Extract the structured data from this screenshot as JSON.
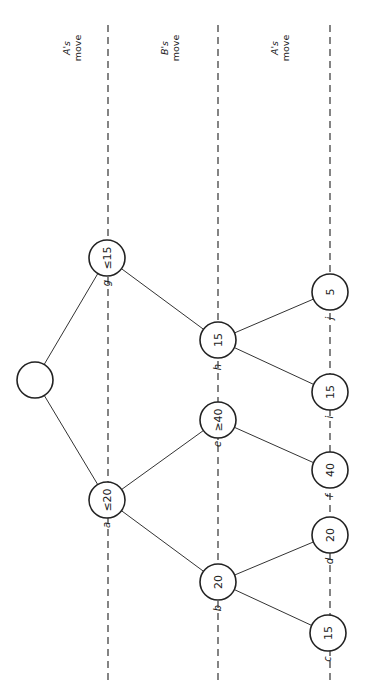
{
  "diagram": {
    "ply_labels": [
      {
        "player": "A's",
        "word": "move",
        "x": 68
      },
      {
        "player": "B's",
        "word": "move",
        "x": 170
      },
      {
        "player": "A's",
        "word": "move",
        "x": 280
      }
    ],
    "levels_x": [
      108,
      218,
      330
    ],
    "nodes": {
      "root": {
        "value": "",
        "label": ""
      },
      "g": {
        "value": "≤15",
        "label": "g"
      },
      "a": {
        "value": "≤20",
        "label": "a"
      },
      "h": {
        "value": "15",
        "label": "h"
      },
      "e": {
        "value": "≥40",
        "label": "e"
      },
      "b": {
        "value": "20",
        "label": "b"
      },
      "j": {
        "value": "5",
        "label": "j"
      },
      "i": {
        "value": "15",
        "label": "i"
      },
      "f": {
        "value": "40",
        "label": "f"
      },
      "d": {
        "value": "20",
        "label": "d"
      },
      "c": {
        "value": "15",
        "label": "c"
      }
    },
    "edges": [
      [
        "root",
        "g"
      ],
      [
        "root",
        "a"
      ],
      [
        "g",
        "h"
      ],
      [
        "a",
        "e"
      ],
      [
        "a",
        "b"
      ],
      [
        "h",
        "j"
      ],
      [
        "h",
        "i"
      ],
      [
        "e",
        "f"
      ],
      [
        "b",
        "d"
      ],
      [
        "b",
        "c"
      ]
    ]
  }
}
